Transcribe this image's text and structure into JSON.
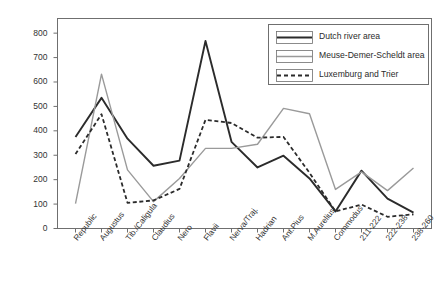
{
  "chart_data": {
    "type": "line",
    "title": "",
    "xlabel": "",
    "ylabel": "Number of coins",
    "ylim": [
      0,
      860
    ],
    "yticks": [
      0,
      100,
      200,
      300,
      400,
      500,
      600,
      700,
      800
    ],
    "grid": false,
    "legend_position": "top-right",
    "categories": [
      "Republic",
      "Augustus",
      "Tib./Caligula",
      "Claudius",
      "Nero",
      "Flavii",
      "Nerva/Traj.",
      "Hadrian",
      "Ant.Pius",
      "M.Aurelius",
      "Commodus",
      "211-222",
      "222-238",
      "238-260"
    ],
    "series": [
      {
        "name": "Dutch river area",
        "color": "#2b2b2b",
        "style": "solid",
        "values": [
          375,
          535,
          368,
          257,
          278,
          768,
          355,
          250,
          298,
          205,
          70,
          237,
          122,
          65
        ]
      },
      {
        "name": "Meuse-Demer-Scheldt area",
        "color": "#9a9a9a",
        "style": "solid",
        "values": [
          102,
          632,
          240,
          110,
          205,
          328,
          328,
          345,
          492,
          470,
          160,
          232,
          155,
          248
        ]
      },
      {
        "name": "Luxemburg and Trier",
        "color": "#2b2b2b",
        "style": "dashed",
        "values": [
          305,
          468,
          105,
          115,
          162,
          445,
          432,
          372,
          375,
          228,
          70,
          98,
          48,
          58
        ]
      }
    ]
  },
  "legend": {
    "items": [
      {
        "label": "Dutch river area"
      },
      {
        "label": "Meuse-Demer-Scheldt area"
      },
      {
        "label": "Luxemburg and Trier"
      }
    ]
  },
  "yaxis": {
    "ticks": [
      "800",
      "700",
      "600",
      "500",
      "400",
      "300",
      "200",
      "100",
      "0"
    ],
    "title": "Number of coins"
  }
}
